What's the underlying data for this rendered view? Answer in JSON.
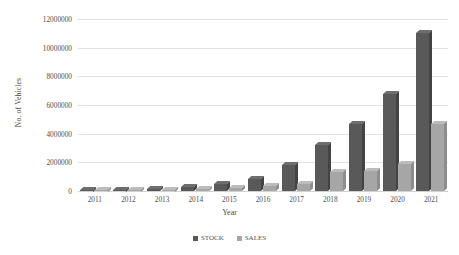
{
  "chart_data": {
    "type": "bar",
    "title": "",
    "xlabel": "Year",
    "ylabel": "No. of Vehicles",
    "categories": [
      "2011",
      "2012",
      "2013",
      "2014",
      "2015",
      "2016",
      "2017",
      "2018",
      "2019",
      "2020",
      "2021"
    ],
    "series": [
      {
        "name": "STOCK",
        "color": "#595959",
        "values": [
          50000,
          90000,
          150000,
          280000,
          500000,
          850000,
          1800000,
          3200000,
          4700000,
          6800000,
          11000000
        ]
      },
      {
        "name": "SALES",
        "color": "#A6A6A6",
        "values": [
          30000,
          60000,
          80000,
          130000,
          230000,
          350000,
          500000,
          1300000,
          1400000,
          1900000,
          4700000
        ]
      }
    ],
    "ylim": [
      0,
      12000000
    ],
    "ytick_labels": [
      "0",
      "2000000",
      "4000000",
      "6000000",
      "8000000",
      "10000000",
      "12000000"
    ],
    "ytick_values": [
      0,
      2000000,
      4000000,
      6000000,
      8000000,
      10000000,
      12000000
    ],
    "grid": true,
    "legend_position": "bottom"
  }
}
